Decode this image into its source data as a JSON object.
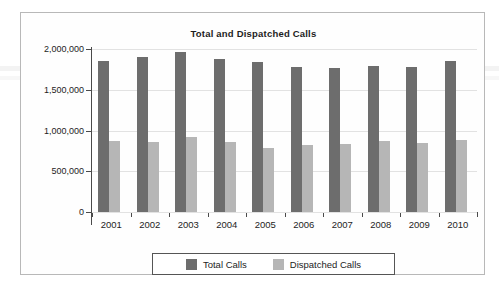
{
  "chart_data": {
    "type": "bar",
    "title": "Total and Dispatched Calls",
    "xlabel": "",
    "ylabel": "",
    "categories": [
      "2001",
      "2002",
      "2003",
      "2004",
      "2005",
      "2006",
      "2007",
      "2008",
      "2009",
      "2010"
    ],
    "series": [
      {
        "name": "Total Calls",
        "color": "#6d6d6d",
        "values": [
          1850000,
          1900000,
          1960000,
          1880000,
          1845000,
          1780000,
          1770000,
          1790000,
          1780000,
          1850000
        ]
      },
      {
        "name": "Dispatched Calls",
        "color": "#b6b6b6",
        "values": [
          870000,
          865000,
          920000,
          860000,
          785000,
          820000,
          835000,
          870000,
          845000,
          885000
        ]
      }
    ],
    "ylim": [
      0,
      2000000
    ],
    "y_ticks": [
      0,
      500000,
      1000000,
      1500000,
      2000000
    ],
    "y_tick_labels": [
      "0",
      "500,000",
      "1,000,000",
      "1,500,000",
      "2,000,000"
    ],
    "grid": true,
    "legend_position": "bottom"
  },
  "legend": {
    "items": [
      {
        "label": "Total Calls",
        "color": "#6d6d6d"
      },
      {
        "label": "Dispatched Calls",
        "color": "#b6b6b6"
      }
    ]
  }
}
